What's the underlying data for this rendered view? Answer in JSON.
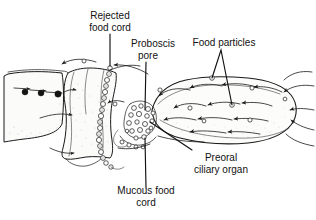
{
  "figure": {
    "kind": "scientific-line-drawing",
    "background_color": "#ffffff",
    "ink_color": "#1a1a1a",
    "text_color": "#111111"
  },
  "labels": {
    "rejected_food_cord": {
      "line1": "Rejected",
      "line2": "food cord"
    },
    "proboscis_pore": {
      "line1": "Proboscis",
      "line2": "pore"
    },
    "food_particles": {
      "line1": "Food particles"
    },
    "preoral_ciliary_organ": {
      "line1": "Preoral",
      "line2": "ciliary organ"
    },
    "mucous_food_cord": {
      "line1": "Mucous food",
      "line2": "cord"
    }
  },
  "features": {
    "food_particle_marker": "small-open-circle",
    "suspended_particle_marker": "filled-black-circle",
    "current_marker": "arrowhead",
    "mucous_cord_marker": "chain-of-open-circles"
  }
}
